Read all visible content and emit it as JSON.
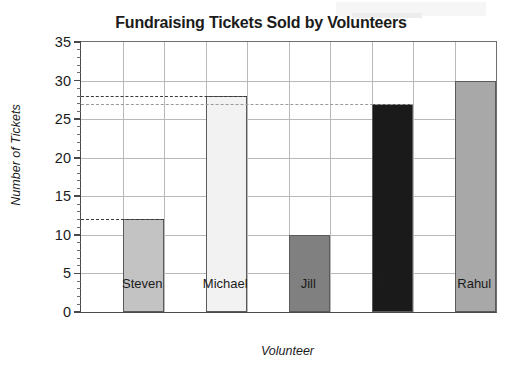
{
  "chart_data": {
    "type": "bar",
    "title": "Fundraising Tickets Sold by Volunteers",
    "xlabel": "Volunteer",
    "ylabel": "Number of Tickets",
    "categories": [
      "Steven",
      "Michael",
      "Jill",
      "Zach",
      "Rahul"
    ],
    "values": [
      12,
      28,
      10,
      27,
      30
    ],
    "bar_colors": [
      "#c3c3c3",
      "#f2f2f2",
      "#808080",
      "#1a1a1a",
      "#a8a8a8"
    ],
    "ylim": [
      0,
      35
    ],
    "ytick_values": [
      0,
      5,
      10,
      15,
      20,
      25,
      30,
      35
    ],
    "ytick_labels": [
      "0",
      "5",
      "10",
      "15",
      "20",
      "25",
      "30",
      "35"
    ],
    "yminor_step": 1,
    "grid": "both",
    "legend": "none",
    "annotations": [
      {
        "label": "28",
        "value": 28,
        "extends_to": "Michael",
        "style": "dark-dashed"
      },
      {
        "label": "27",
        "value": 27,
        "extends_to": "Zach",
        "style": "light-dashed"
      },
      {
        "label": "12",
        "value": 12,
        "extends_to": "Steven",
        "style": "dark-dashed"
      }
    ],
    "series": [
      {
        "name": "Tickets Sold",
        "values": [
          12,
          28,
          10,
          27,
          30
        ]
      }
    ]
  }
}
